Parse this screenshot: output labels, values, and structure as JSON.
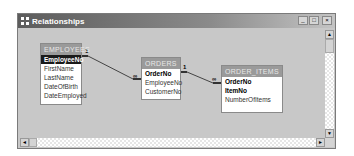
{
  "window": {
    "title": "Relationships",
    "buttons": {
      "minimize": "_",
      "maximize": "□",
      "close": "×"
    }
  },
  "tables": [
    {
      "name": "EMPLOYEES",
      "fields": [
        {
          "label": "EmployeeNo",
          "primary_key": true,
          "selected": true
        },
        {
          "label": "FirstName",
          "primary_key": false
        },
        {
          "label": "LastName",
          "primary_key": false
        },
        {
          "label": "DateOfBirth",
          "primary_key": false
        },
        {
          "label": "DateEmployed",
          "primary_key": false
        }
      ]
    },
    {
      "name": "ORDERS",
      "fields": [
        {
          "label": "OrderNo",
          "primary_key": true
        },
        {
          "label": "EmployeeNo",
          "primary_key": false
        },
        {
          "label": "CustomerNo",
          "primary_key": false
        }
      ]
    },
    {
      "name": "ORDER_ITEMS",
      "fields": [
        {
          "label": "OrderNo",
          "primary_key": true
        },
        {
          "label": "ItemNo",
          "primary_key": true
        },
        {
          "label": "NumberOfItems",
          "primary_key": false
        }
      ]
    }
  ],
  "relationships": [
    {
      "from": "EMPLOYEES.EmployeeNo",
      "to": "ORDERS.EmployeeNo",
      "one_label": "1",
      "many_label": "∞"
    },
    {
      "from": "ORDERS.OrderNo",
      "to": "ORDER_ITEMS.OrderNo",
      "one_label": "1",
      "many_label": "∞"
    }
  ],
  "scrollbars": {
    "up": "▲",
    "down": "▼",
    "left": "◄",
    "right": "►"
  }
}
